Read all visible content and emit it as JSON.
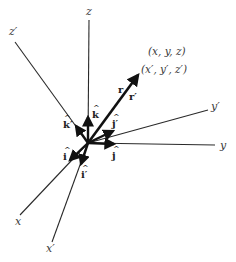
{
  "diagram": {
    "origin": [
      88,
      143
    ],
    "axes": [
      {
        "name": "z",
        "label": "z",
        "end": [
          89,
          20
        ],
        "label_pos": [
          86,
          15
        ]
      },
      {
        "name": "z-prime",
        "label": "z′",
        "end": [
          15,
          42
        ],
        "label_pos": [
          9,
          35
        ]
      },
      {
        "name": "y-prime",
        "label": "y′",
        "end": [
          208,
          110
        ],
        "label_pos": [
          211,
          110
        ]
      },
      {
        "name": "y",
        "label": "y",
        "end": [
          215,
          145
        ],
        "label_pos": [
          220,
          149
        ]
      },
      {
        "name": "x",
        "label": "x",
        "end": [
          20,
          215
        ],
        "label_pos": [
          15,
          225
        ]
      },
      {
        "name": "x-prime",
        "label": "x′",
        "end": [
          52,
          242
        ],
        "label_pos": [
          46,
          252
        ]
      }
    ],
    "unit_vectors": [
      {
        "name": "k-hat",
        "label": "k",
        "end": [
          88,
          117
        ],
        "label_pos": [
          92,
          118
        ]
      },
      {
        "name": "k-prime-hat",
        "label": "k′",
        "end": [
          76,
          126
        ],
        "label_pos": [
          63,
          128
        ]
      },
      {
        "name": "j-prime-hat",
        "label": "j′",
        "end": [
          113,
          131
        ],
        "label_pos": [
          112,
          127
        ]
      },
      {
        "name": "j-hat",
        "label": "j",
        "end": [
          114,
          144
        ],
        "label_pos": [
          112,
          159
        ]
      },
      {
        "name": "i-hat",
        "label": "i",
        "end": [
          70,
          160
        ],
        "label_pos": [
          63,
          160
        ]
      },
      {
        "name": "i-prime-hat",
        "label": "i′",
        "end": [
          81,
          164
        ],
        "label_pos": [
          81,
          178
        ]
      }
    ],
    "position_vector": {
      "label_r": "r",
      "label_r_prime": "r′",
      "end": [
        138,
        75
      ],
      "label_r_pos": [
        118,
        93
      ],
      "label_r_prime_pos": [
        129,
        100
      ]
    },
    "point_labels": {
      "unprimed": "(x, y, z)",
      "primed": "(x′, y′, z′)",
      "unprimed_pos": [
        148,
        55
      ],
      "primed_pos": [
        141,
        73
      ]
    },
    "hat_glyph": "^",
    "colors": {
      "line": "#2a2a2a",
      "bold": "#111111",
      "text": "#3a3a3a",
      "background": "#ffffff"
    }
  }
}
